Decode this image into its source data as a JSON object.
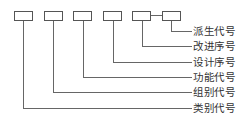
{
  "diagram": {
    "type": "code-structure",
    "boxes": [
      {
        "id": "box-1",
        "x": 14
      },
      {
        "id": "box-2",
        "x": 44
      },
      {
        "id": "box-3",
        "x": 73
      },
      {
        "id": "box-4",
        "x": 103
      },
      {
        "id": "box-5",
        "x": 132
      },
      {
        "id": "box-6",
        "x": 162
      }
    ],
    "labels": [
      {
        "text": "派生代号",
        "box": 6
      },
      {
        "text": "改进序号",
        "box": 5
      },
      {
        "text": "设计序号",
        "box": 4
      },
      {
        "text": "功能代号",
        "box": 3
      },
      {
        "text": "组别代号",
        "box": 2
      },
      {
        "text": "类别代号",
        "box": 1
      }
    ],
    "colors": {
      "line": "#666666",
      "text": "#333333",
      "box_border": "#555555"
    }
  }
}
